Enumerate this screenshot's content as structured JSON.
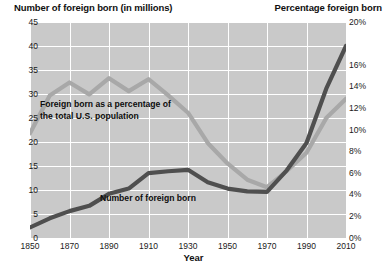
{
  "titles": {
    "left_axis": "Number of foreign born (in millions)",
    "right_axis": "Percentage foreign born",
    "x_axis": "Year"
  },
  "annotations": {
    "percentage_line": {
      "line1": "Foreign born as a percentage of",
      "line2": "the total U.S. population"
    },
    "number_line": "Number of foreign born"
  },
  "colors": {
    "plot_background": "#c9c9c9",
    "gridline": "#ffffff",
    "number_series": "#4f4f4f",
    "percentage_series": "#a8a8a8",
    "text": "#101010"
  },
  "chart_data": {
    "type": "line",
    "title": "",
    "xlabel": "Year",
    "ylabel": "Number of foreign born (in millions)",
    "y2label": "Percentage foreign born",
    "grid": true,
    "legend": "in-plot annotations",
    "x": [
      1850,
      1860,
      1870,
      1880,
      1890,
      1900,
      1910,
      1920,
      1930,
      1940,
      1950,
      1960,
      1970,
      1980,
      1990,
      2000,
      2010
    ],
    "xlim": [
      1850,
      2010
    ],
    "xticks": [
      1850,
      1870,
      1890,
      1910,
      1930,
      1950,
      1970,
      1990,
      2010
    ],
    "ylim": [
      0,
      45
    ],
    "yticks": [
      0,
      5,
      10,
      15,
      20,
      25,
      30,
      35,
      40,
      45
    ],
    "ytick_labels": [
      "0",
      "5",
      "10",
      "15",
      "20",
      "25",
      "30",
      "35",
      "40",
      "45"
    ],
    "y2lim": [
      0,
      20
    ],
    "y2ticks": [
      0,
      2,
      4,
      6,
      8,
      10,
      12,
      14,
      16,
      20
    ],
    "y2tick_labels": [
      "0%",
      "2%",
      "4%",
      "6%",
      "8%",
      "10%",
      "12%",
      "14%",
      "16%",
      "20%"
    ],
    "series": [
      {
        "name": "Number of foreign born",
        "axis": "left",
        "unit": "millions",
        "color": "#4f4f4f",
        "values": [
          2.2,
          4.1,
          5.6,
          6.7,
          9.2,
          10.3,
          13.5,
          13.9,
          14.2,
          11.6,
          10.3,
          9.7,
          9.6,
          14.1,
          19.8,
          31.1,
          40.0
        ]
      },
      {
        "name": "Foreign born as a percentage of the total U.S. population",
        "axis": "right",
        "unit": "percent",
        "color": "#a8a8a8",
        "values": [
          9.7,
          13.2,
          14.4,
          13.3,
          14.8,
          13.6,
          14.7,
          13.2,
          11.6,
          8.8,
          6.9,
          5.4,
          4.7,
          6.2,
          7.9,
          11.1,
          12.9
        ]
      }
    ]
  }
}
